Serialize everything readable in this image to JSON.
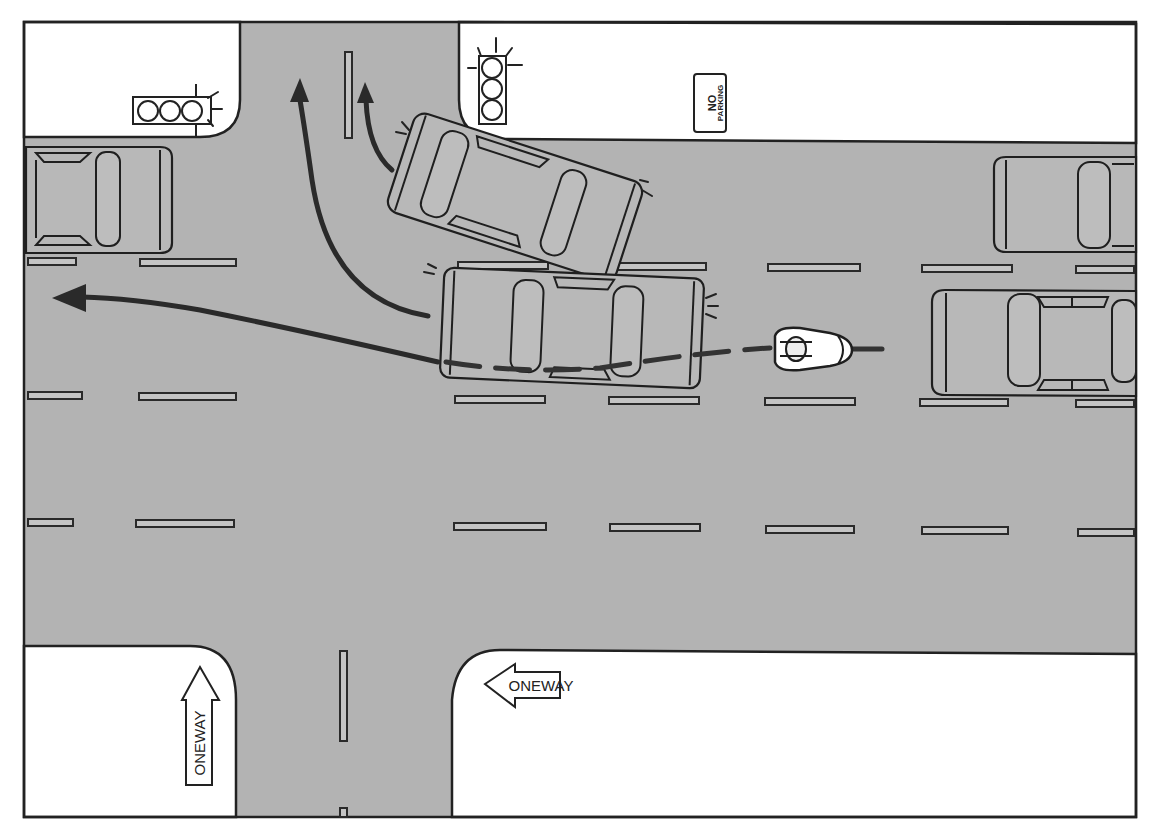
{
  "scene": {
    "title": "",
    "colors": {
      "road": "#b3b3b3",
      "sidewalk": "#ffffff",
      "outline": "#222222",
      "path_arrows": "#2a2a2a"
    },
    "signs": {
      "no_parking": {
        "line1": "NO",
        "line2": "PARKING"
      },
      "one_way_vertical": {
        "text": "ONEWAY",
        "direction": "up"
      },
      "one_way_horizontal": {
        "text": "ONEWAY",
        "direction": "left"
      }
    },
    "traffic_lights": [
      {
        "id": "left-light",
        "orientation": "horizontal",
        "lamps": 3
      },
      {
        "id": "top-light",
        "orientation": "vertical",
        "lamps": 3
      }
    ],
    "vehicles": [
      {
        "id": "parked-car-left",
        "type": "car",
        "role": "parked"
      },
      {
        "id": "turning-car",
        "type": "car",
        "role": "turning left from lane"
      },
      {
        "id": "center-car",
        "type": "car",
        "role": "changing lanes"
      },
      {
        "id": "parked-car-right-top",
        "type": "car",
        "role": "parked"
      },
      {
        "id": "car-right-lane",
        "type": "car",
        "role": "in lane behind motorcycle"
      },
      {
        "id": "motorcycle",
        "type": "motorcycle",
        "role": "following dashed path"
      }
    ],
    "paths": [
      {
        "id": "left-turn-arrow-outer",
        "style": "solid arrow"
      },
      {
        "id": "left-turn-arrow-inner",
        "style": "solid arrow"
      },
      {
        "id": "straight-left-arrow",
        "style": "solid arrow"
      },
      {
        "id": "motorcycle-path",
        "style": "dashed"
      }
    ]
  }
}
